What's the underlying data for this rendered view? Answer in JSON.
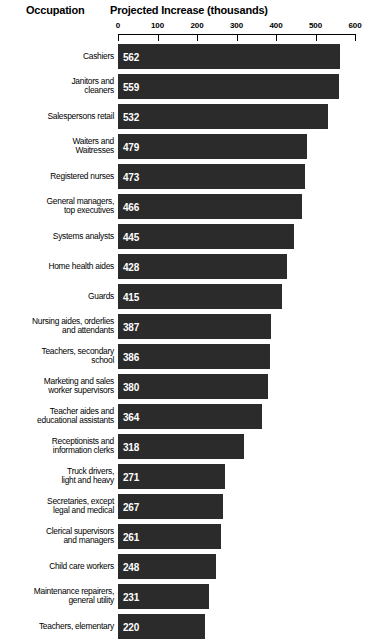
{
  "header": {
    "occupation_label": "Occupation",
    "chart_title": "Projected Increase (thousands)"
  },
  "chart_data": {
    "type": "bar",
    "orientation": "horizontal",
    "title": "Projected Increase (thousands)",
    "xlabel": "Projected Increase (thousands)",
    "ylabel": "Occupation",
    "xlim": [
      0,
      600
    ],
    "xticks": [
      0,
      100,
      200,
      300,
      400,
      500,
      600
    ],
    "grid": false,
    "legend": false,
    "bar_color": "#2b2b2b",
    "value_label_color": "#ffffff",
    "background_color": "#ffffff",
    "categories": [
      "Cashiers",
      "Janitors and cleaners",
      "Salespersons retail",
      "Waiters and Waitresses",
      "Registered nurses",
      "General managers, top executives",
      "Systems analysts",
      "Home health aides",
      "Guards",
      "Nursing aides, orderlies and attendants",
      "Teachers, secondary school",
      "Marketing and sales worker supervisors",
      "Teacher aides and educational assistants",
      "Receptionists and information clerks",
      "Truck drivers, light and heavy",
      "Secretaries, except legal and medical",
      "Clerical supervisors and managers",
      "Child care workers",
      "Maintenance repairers, general utility",
      "Teachers, elementary"
    ],
    "values": [
      562,
      559,
      532,
      479,
      473,
      466,
      445,
      428,
      415,
      387,
      386,
      380,
      364,
      318,
      271,
      267,
      261,
      248,
      231,
      220
    ]
  },
  "rows": [
    {
      "label_lines": [
        "Cashiers"
      ],
      "value": 562
    },
    {
      "label_lines": [
        "Janitors and",
        "cleaners"
      ],
      "value": 559
    },
    {
      "label_lines": [
        "Salespersons retail"
      ],
      "value": 532
    },
    {
      "label_lines": [
        "Waiters and",
        "Waitresses"
      ],
      "value": 479
    },
    {
      "label_lines": [
        "Registered nurses"
      ],
      "value": 473
    },
    {
      "label_lines": [
        "General managers,",
        "top executives"
      ],
      "value": 466
    },
    {
      "label_lines": [
        "Systems analysts"
      ],
      "value": 445
    },
    {
      "label_lines": [
        "Home health aides"
      ],
      "value": 428
    },
    {
      "label_lines": [
        "Guards"
      ],
      "value": 415
    },
    {
      "label_lines": [
        "Nursing aides, orderlies",
        "and attendants"
      ],
      "value": 387
    },
    {
      "label_lines": [
        "Teachers, secondary",
        "school"
      ],
      "value": 386
    },
    {
      "label_lines": [
        "Marketing and sales",
        "worker supervisors"
      ],
      "value": 380
    },
    {
      "label_lines": [
        "Teacher aides and",
        "educational assistants"
      ],
      "value": 364
    },
    {
      "label_lines": [
        "Receptionists and",
        "information clerks"
      ],
      "value": 318
    },
    {
      "label_lines": [
        "Truck drivers,",
        "light and heavy"
      ],
      "value": 271
    },
    {
      "label_lines": [
        "Secretaries, except",
        "legal and medical"
      ],
      "value": 267
    },
    {
      "label_lines": [
        "Clerical supervisors",
        "and managers"
      ],
      "value": 261
    },
    {
      "label_lines": [
        "Child care workers"
      ],
      "value": 248
    },
    {
      "label_lines": [
        "Maintenance repairers,",
        "general utility"
      ],
      "value": 231
    },
    {
      "label_lines": [
        "Teachers, elementary"
      ],
      "value": 220
    }
  ]
}
